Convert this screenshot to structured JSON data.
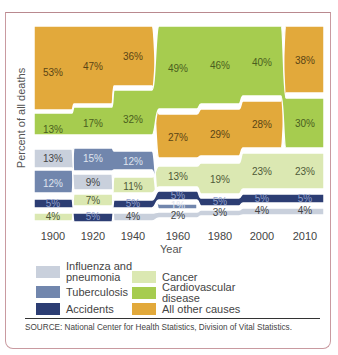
{
  "chart_data": {
    "type": "area",
    "title": "",
    "xlabel": "Year",
    "ylabel": "Percent of all deaths",
    "categories": [
      "1900",
      "1920",
      "1940",
      "1960",
      "1980",
      "2000",
      "2010"
    ],
    "series": [
      {
        "name": "All other causes",
        "color": "#e2a93b",
        "values": [
          53,
          47,
          36,
          27,
          29,
          28,
          38
        ]
      },
      {
        "name": "Cardiovascular disease",
        "color": "#a6cc4f",
        "values": [
          13,
          17,
          32,
          49,
          46,
          40,
          30
        ]
      },
      {
        "name": "Cancer",
        "color": "#dbe8b2",
        "values": [
          4,
          7,
          11,
          13,
          19,
          23,
          23
        ]
      },
      {
        "name": "Tuberculosis",
        "color": "#7186ad",
        "values": [
          12,
          15,
          12,
          1,
          0,
          0,
          0
        ]
      },
      {
        "name": "Influenza and pneumonia",
        "color": "#c9d0dc",
        "values": [
          13,
          9,
          4,
          2,
          3,
          4,
          4
        ]
      },
      {
        "name": "Accidents",
        "color": "#2c3d73",
        "values": [
          5,
          5,
          5,
          5,
          5,
          5,
          5
        ]
      }
    ],
    "ylim": [
      0,
      100
    ],
    "grid": false,
    "legend_position": "bottom",
    "annotations": [
      "SOURCE: National Center for Health Statistics, Division of Vital Statistics."
    ]
  },
  "labels": {
    "ylabel": "Percent of all deaths",
    "xlabel": "Year",
    "source": "SOURCE: National Center for Health Statistics, Division of Vital Statistics."
  },
  "legend": [
    {
      "label": "Influenza and pneumonia",
      "line1": "Influenza and",
      "line2": "pneumonia",
      "color": "#c9d0dc"
    },
    {
      "label": "Tuberculosis",
      "line1": "Tuberculosis",
      "line2": "",
      "color": "#7186ad"
    },
    {
      "label": "Accidents",
      "line1": "Accidents",
      "line2": "",
      "color": "#2c3d73"
    },
    {
      "label": "Cancer",
      "line1": "Cancer",
      "line2": "",
      "color": "#dbe8b2"
    },
    {
      "label": "Cardiovascular disease",
      "line1": "Cardiovascular",
      "line2": "disease",
      "color": "#a6cc4f"
    },
    {
      "label": "All other causes",
      "line1": "All other causes",
      "line2": "",
      "color": "#e2a93b"
    }
  ],
  "columns": [
    {
      "year": "1900",
      "x": 53,
      "bands": [
        {
          "s": "All other causes",
          "y0": 26,
          "y1": 110,
          "label": "53%",
          "ly": 76
        },
        {
          "s": "Cardiovascular disease",
          "y0": 113,
          "y1": 135,
          "label": "13%",
          "ly": 133
        },
        {
          "s": "Influenza and pneumonia",
          "y0": 149,
          "y1": 168,
          "label": "13%",
          "ly": 162
        },
        {
          "s": "Tuberculosis",
          "y0": 170,
          "y1": 193,
          "label": "12%",
          "ly": 187
        },
        {
          "s": "Accidents",
          "y0": 199,
          "y1": 208,
          "label": "5%",
          "ly": 207
        },
        {
          "s": "Cancer",
          "y0": 213,
          "y1": 221,
          "label": "4%",
          "ly": 220
        }
      ]
    },
    {
      "year": "1920",
      "x": 93,
      "bands": [
        {
          "s": "All other causes",
          "y0": 26,
          "y1": 104,
          "label": "47%",
          "ly": 70
        },
        {
          "s": "Cardiovascular disease",
          "y0": 107,
          "y1": 135,
          "label": "17%",
          "ly": 127
        },
        {
          "s": "Tuberculosis",
          "y0": 148,
          "y1": 171,
          "label": "15%",
          "ly": 162
        },
        {
          "s": "Influenza and pneumonia",
          "y0": 174,
          "y1": 190,
          "label": "9%",
          "ly": 186
        },
        {
          "s": "Cancer",
          "y0": 194,
          "y1": 206,
          "label": "7%",
          "ly": 204
        },
        {
          "s": "Accidents",
          "y0": 213,
          "y1": 222,
          "label": "5%",
          "ly": 220
        }
      ]
    },
    {
      "year": "1940",
      "x": 133,
      "bands": [
        {
          "s": "All other causes",
          "y0": 26,
          "y1": 86,
          "label": "36%",
          "ly": 60
        },
        {
          "s": "Cardiovascular disease",
          "y0": 90,
          "y1": 135,
          "label": "32%",
          "ly": 123
        },
        {
          "s": "Tuberculosis",
          "y0": 151,
          "y1": 170,
          "label": "12%",
          "ly": 165
        },
        {
          "s": "Cancer",
          "y0": 177,
          "y1": 193,
          "label": "11%",
          "ly": 190
        },
        {
          "s": "Accidents",
          "y0": 200,
          "y1": 208,
          "label": "5%",
          "ly": 207
        },
        {
          "s": "Influenza and pneumonia",
          "y0": 213,
          "y1": 221,
          "label": "4%",
          "ly": 220
        }
      ]
    },
    {
      "year": "1960",
      "x": 178,
      "bands": [
        {
          "s": "Cardiovascular disease",
          "y0": 26,
          "y1": 109,
          "label": "49%",
          "ly": 72
        },
        {
          "s": "All other causes",
          "y0": 114,
          "y1": 158,
          "label": "27%",
          "ly": 141
        },
        {
          "s": "Cancer",
          "y0": 166,
          "y1": 187,
          "label": "13%",
          "ly": 180
        },
        {
          "s": "Accidents",
          "y0": 191,
          "y1": 200,
          "label": "5%",
          "ly": 199
        },
        {
          "s": "Tuberculosis",
          "y0": 204,
          "y1": 209,
          "label": "1%",
          "ly": 209
        },
        {
          "s": "Influenza and pneumonia",
          "y0": 212,
          "y1": 218,
          "label": "2%",
          "ly": 219
        }
      ]
    },
    {
      "year": "1980",
      "x": 220,
      "bands": [
        {
          "s": "Cardiovascular disease",
          "y0": 26,
          "y1": 104,
          "label": "46%",
          "ly": 69
        },
        {
          "s": "All other causes",
          "y0": 109,
          "y1": 156,
          "label": "29%",
          "ly": 138
        },
        {
          "s": "Cancer",
          "y0": 163,
          "y1": 194,
          "label": "19%",
          "ly": 183
        },
        {
          "s": "Accidents",
          "y0": 198,
          "y1": 206,
          "label": "5%",
          "ly": 205
        },
        {
          "s": "Influenza and pneumonia",
          "y0": 210,
          "y1": 216,
          "label": "3%",
          "ly": 216
        }
      ]
    },
    {
      "year": "2000",
      "x": 262,
      "bands": [
        {
          "s": "Cardiovascular disease",
          "y0": 26,
          "y1": 96,
          "label": "40%",
          "ly": 66
        },
        {
          "s": "All other causes",
          "y0": 101,
          "y1": 148,
          "label": "28%",
          "ly": 128
        },
        {
          "s": "Cancer",
          "y0": 153,
          "y1": 189,
          "label": "23%",
          "ly": 175
        },
        {
          "s": "Accidents",
          "y0": 194,
          "y1": 203,
          "label": "5%",
          "ly": 202
        },
        {
          "s": "Influenza and pneumonia",
          "y0": 208,
          "y1": 215,
          "label": "4%",
          "ly": 214
        }
      ]
    },
    {
      "year": "2010",
      "x": 305,
      "bands": [
        {
          "s": "All other causes",
          "y0": 26,
          "y1": 93,
          "label": "38%",
          "ly": 64
        },
        {
          "s": "Cardiovascular disease",
          "y0": 98,
          "y1": 148,
          "label": "30%",
          "ly": 127
        },
        {
          "s": "Cancer",
          "y0": 153,
          "y1": 189,
          "label": "23%",
          "ly": 175
        },
        {
          "s": "Accidents",
          "y0": 194,
          "y1": 203,
          "label": "5%",
          "ly": 202
        },
        {
          "s": "Influenza and pneumonia",
          "y0": 208,
          "y1": 215,
          "label": "4%",
          "ly": 214
        }
      ]
    }
  ]
}
